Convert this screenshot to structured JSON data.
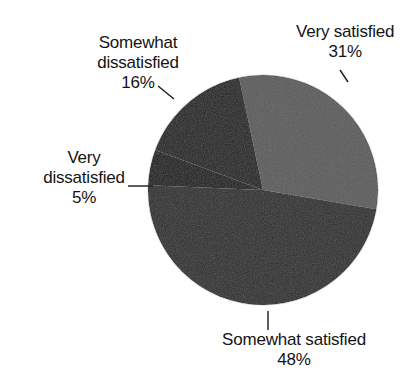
{
  "chart_data": {
    "type": "pie",
    "title": "",
    "subtitle": "",
    "xlabel": "",
    "ylabel": "",
    "legend_position": "none",
    "grid": false,
    "units": "percent",
    "labels_show_percent": true,
    "categories": [
      "Very satisfied",
      "Somewhat satisfied",
      "Very dissatisfied",
      "Somewhat dissatisfied"
    ],
    "values": [
      31,
      48,
      5,
      16
    ],
    "slices": [
      {
        "name": "Very satisfied",
        "value": 31,
        "percent_label": "31%",
        "color": "#5b5b5b",
        "start_angle_deg": -12.0,
        "sweep_deg": 111.6,
        "label_position": "top-right",
        "leader": "diagonal"
      },
      {
        "name": "Somewhat satisfied",
        "value": 48,
        "percent_label": "48%",
        "color": "#2b2b2b",
        "start_angle_deg": 99.6,
        "sweep_deg": 172.8,
        "label_position": "bottom",
        "leader": "vertical"
      },
      {
        "name": "Very dissatisfied",
        "value": 5,
        "percent_label": "5%",
        "color": "#141414",
        "start_angle_deg": 272.4,
        "sweep_deg": 18.0,
        "label_position": "left",
        "leader": "horizontal"
      },
      {
        "name": "Somewhat dissatisfied",
        "value": 16,
        "percent_label": "16%",
        "color": "#1e1e1e",
        "start_angle_deg": 290.4,
        "sweep_deg": 57.6,
        "label_position": "top-left",
        "leader": "diagonal"
      }
    ],
    "geometry": {
      "center_x": 263,
      "center_y": 190,
      "radius": 115
    }
  },
  "labels": {
    "very_satisfied": {
      "line1": "Very satisfied",
      "percent": "31%"
    },
    "somewhat_dissatisfied": {
      "line1": "Somewhat",
      "line2": "dissatisfied",
      "percent": "16%"
    },
    "very_dissatisfied": {
      "line1": "Very",
      "line2": "dissatisfied",
      "percent": "5%"
    },
    "somewhat_satisfied": {
      "line1": "Somewhat satisfied",
      "percent": "48%"
    }
  },
  "colors": {
    "background": "#ffffff",
    "text": "#141414",
    "leader_line": "#1a1a1a",
    "slice_very_satisfied": "#5b5b5b",
    "slice_somewhat_satisfied": "#2b2b2b",
    "slice_very_dissatisfied": "#141414",
    "slice_somewhat_dissatisfied": "#1e1e1e"
  }
}
